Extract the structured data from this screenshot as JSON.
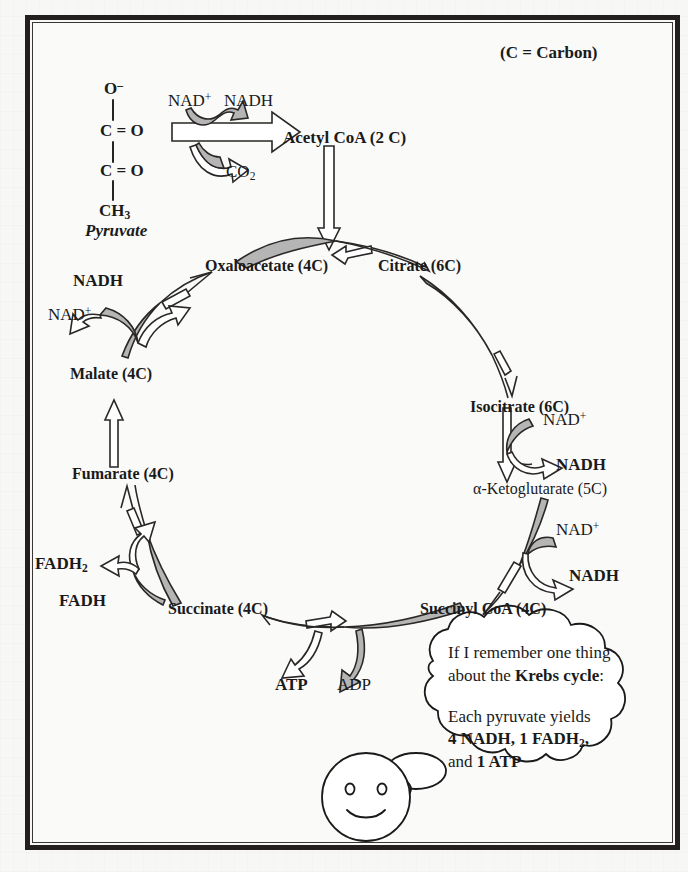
{
  "figure": {
    "legend_note": "(C = Carbon)",
    "colors": {
      "ink": "#1a1a1a",
      "arrow_fill_gray": "#b5b5b5",
      "arrow_outline": "#2a2726",
      "paper": "#f7f7f6",
      "frame": "#231f1e"
    }
  },
  "pyruvate_structure": {
    "name": "Pyruvate",
    "atoms": [
      "O",
      "C = O",
      "C = O",
      "CH"
    ],
    "top_label": "O",
    "top_charge": "–",
    "row2": "C = O",
    "row3": "C = O",
    "row4_base": "CH",
    "row4_sub": "3",
    "caption": "Pyruvate"
  },
  "decarboxylation_step": {
    "reactant_in": "NAD",
    "reactant_in_sup": "+",
    "product_out": "NADH",
    "released": "CO",
    "released_sub": "2",
    "product": "Acetyl CoA (2 C)"
  },
  "cycle_nodes": [
    {
      "id": "oxaloacetate",
      "label": "Oxaloacetate (4C)",
      "bold": true,
      "carbons": 4
    },
    {
      "id": "citrate",
      "label": "Citrate (6C)",
      "bold": true,
      "carbons": 6
    },
    {
      "id": "isocitrate",
      "label": "Isocitrate (6C)",
      "bold": true,
      "carbons": 6
    },
    {
      "id": "ketoglutarate",
      "label": "α-Ketoglutarate (5C)",
      "bold": false,
      "carbons": 5
    },
    {
      "id": "succinyl-coa",
      "label": "Succinyl CoA (4C)",
      "bold": true,
      "carbons": 4
    },
    {
      "id": "succinate",
      "label": "Succinate (4C)",
      "bold": true,
      "carbons": 4
    },
    {
      "id": "fumarate",
      "label": "Fumarate (4C)",
      "bold": true,
      "carbons": 4
    },
    {
      "id": "malate",
      "label": "Malate (4C)",
      "bold": true,
      "carbons": 4
    }
  ],
  "cofactors": {
    "malate_to_oxaloacetate": {
      "in_base": "NAD",
      "in_sup": "+",
      "out": "NADH"
    },
    "isocitrate_to_ketoglutarate": {
      "in_base": "NAD",
      "in_sup": "+",
      "out": "NADH"
    },
    "ketoglutarate_to_succinyl": {
      "in_base": "NAD",
      "in_sup": "+",
      "out": "NADH"
    },
    "succinate_to_fumarate": {
      "in": "FADH",
      "out_base": "FADH",
      "out_sub": "2"
    },
    "succinyl_to_succinate": {
      "out": "ATP",
      "in": "ADP"
    }
  },
  "thought_bubble": {
    "line1": "If I remember one thing",
    "line2_prefix": "about the ",
    "line2_bold": "Krebs cycle",
    "line2_suffix": ":",
    "line3": "Each pyruvate yields",
    "line4_bold_a": "4 NADH, 1 FADH",
    "line4_sub": "2",
    "line4_bold_b": ",",
    "line5_prefix": "and ",
    "line5_bold": "1 ATP"
  },
  "character": {
    "name": "smiley-face",
    "expression": "smiling"
  }
}
